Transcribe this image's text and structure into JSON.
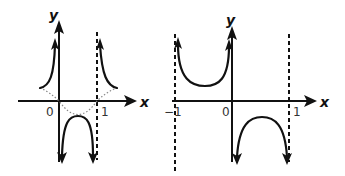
{
  "figure": {
    "panels": [
      {
        "id": "left",
        "axes": {
          "x_label": "x",
          "y_label": "y"
        },
        "ticks": {
          "origin": "0",
          "one": "1"
        },
        "asymptotes": [
          "x = 0",
          "x = 1 (dashed)"
        ],
        "description": "Solid curves: branches going to +infinity near x=0 and x=1 (outside), and a downward-opening branch between 0 and 1 going to -infinity at both ends. Dotted curve: a parabola-like function with zeros at 0 and 1, minimum between them."
      },
      {
        "id": "right",
        "axes": {
          "x_label": "x",
          "y_label": "y"
        },
        "ticks": {
          "minus_one": "−1",
          "origin": "0",
          "one": "1"
        },
        "asymptotes": [
          "x = −1 (dashed)",
          "x = 0",
          "x = 1 (dashed)"
        ],
        "description": "Upward-opening branch between −1 and 0 going to +infinity; downward-opening branch between 0 and 1 going to −infinity."
      }
    ]
  },
  "labels": {
    "left_y": "y",
    "left_x": "x",
    "left_zero": "0",
    "left_one": "1",
    "right_y": "y",
    "right_x": "x",
    "right_minus_one": "−1",
    "right_zero": "0",
    "right_one": "1"
  }
}
